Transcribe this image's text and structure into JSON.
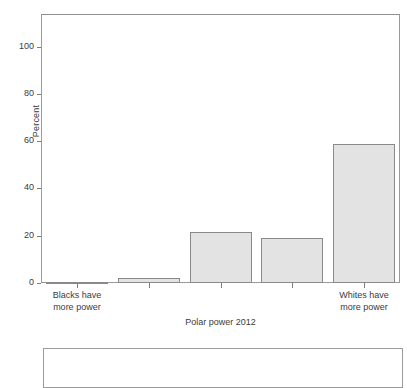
{
  "chart_data": {
    "type": "bar",
    "title": "",
    "subtitle": "",
    "xlabel": "Polar power 2012",
    "ylabel": "Percent",
    "categories": [
      "Blacks have\nmore power",
      "",
      "",
      "",
      "Whites have\nmore power"
    ],
    "values": [
      0.5,
      2.0,
      21.5,
      19.0,
      59.0
    ],
    "ylim": [
      0,
      110
    ],
    "yticks": [
      0,
      20,
      40,
      60,
      80,
      100
    ],
    "ytick_labels": [
      "0",
      "20",
      "40",
      "60",
      "80",
      "100"
    ],
    "grid": false,
    "legend": false,
    "legend_position": "none",
    "series": [
      {
        "name": "Percent",
        "values": [
          0.5,
          2.0,
          21.5,
          19.0,
          59.0
        ]
      }
    ],
    "bar_fill_color": "#e3e3e3",
    "bar_border_color": "#8a8a8a",
    "axis_color": "#9a9a9a",
    "text_color": "#3b3b3b"
  },
  "axes": {
    "y_label": "Percent",
    "x_title": "Polar power 2012",
    "y_ticks": [
      {
        "value": 100,
        "label": "100"
      },
      {
        "value": 80,
        "label": "80"
      },
      {
        "value": 60,
        "label": "60"
      },
      {
        "value": 40,
        "label": "40"
      },
      {
        "value": 20,
        "label": "20"
      },
      {
        "value": 0,
        "label": "0"
      }
    ],
    "x_category_labels": [
      {
        "index": 0,
        "label": "Blacks have\nmore power"
      },
      {
        "index": 4,
        "label": "Whites have\nmore power"
      }
    ]
  },
  "bottom_panel": {
    "content": ""
  }
}
